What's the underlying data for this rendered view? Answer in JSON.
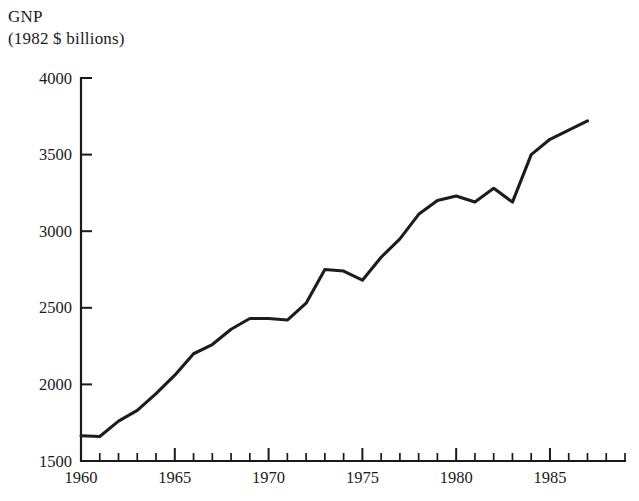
{
  "chart_data": {
    "type": "line",
    "title": "GNP",
    "subtitle": "(1982 $ billions)",
    "xlabel": "",
    "ylabel": "GNP (1982 $ billions)",
    "grid": false,
    "legend": "none",
    "xlim": [
      1960,
      1989
    ],
    "ylim": [
      1500,
      4000
    ],
    "y_ticks": [
      1500,
      2000,
      2500,
      3000,
      3500,
      4000
    ],
    "y_tick_labels": [
      "1500",
      "2000",
      "2500",
      "3000",
      "3500",
      "4000"
    ],
    "x_ticks_major": [
      1960,
      1965,
      1970,
      1975,
      1980,
      1985
    ],
    "x_tick_labels": [
      "1960",
      "1965",
      "1970",
      "1975",
      "1980",
      "1985"
    ],
    "x_ticks_minor": [
      1961,
      1962,
      1963,
      1964,
      1966,
      1967,
      1968,
      1969,
      1971,
      1972,
      1973,
      1974,
      1976,
      1977,
      1978,
      1979,
      1981,
      1982,
      1983,
      1984,
      1986,
      1987,
      1988,
      1989
    ],
    "x": [
      1960,
      1961,
      1962,
      1963,
      1964,
      1965,
      1966,
      1967,
      1968,
      1969,
      1970,
      1971,
      1972,
      1973,
      1974,
      1975,
      1976,
      1977,
      1978,
      1979,
      1980,
      1981,
      1982,
      1983,
      1984,
      1985,
      1986,
      1987
    ],
    "values": [
      1665,
      1660,
      1760,
      1830,
      1940,
      2060,
      2200,
      2260,
      2360,
      2430,
      2430,
      2420,
      2530,
      2750,
      2740,
      2680,
      2830,
      2950,
      3110,
      3200,
      3230,
      3190,
      3280,
      3190,
      3500,
      3600,
      3660,
      3720
    ],
    "series": [
      {
        "name": "GNP",
        "color": "#1c1c1c",
        "values": [
          1665,
          1660,
          1760,
          1830,
          1940,
          2060,
          2200,
          2260,
          2360,
          2430,
          2430,
          2420,
          2530,
          2750,
          2740,
          2680,
          2830,
          2950,
          3110,
          3200,
          3230,
          3190,
          3280,
          3190,
          3500,
          3600,
          3660,
          3720
        ]
      }
    ],
    "annotations": []
  },
  "axes": {
    "y_ticks": [
      {
        "label": "4000",
        "value": 4000
      },
      {
        "label": "3500",
        "value": 3500
      },
      {
        "label": "3000",
        "value": 3000
      },
      {
        "label": "2500",
        "value": 2500
      },
      {
        "label": "2000",
        "value": 2000
      },
      {
        "label": "1500",
        "value": 1500
      }
    ],
    "x_ticks": [
      {
        "label": "1960",
        "value": 1960
      },
      {
        "label": "1965",
        "value": 1965
      },
      {
        "label": "1970",
        "value": 1970
      },
      {
        "label": "1975",
        "value": 1975
      },
      {
        "label": "1980",
        "value": 1980
      },
      {
        "label": "1985",
        "value": 1985
      }
    ]
  },
  "colors": {
    "line": "#1c1c1c",
    "axis": "#1a1a1a",
    "background": "#ffffff",
    "text": "#1a1a1a"
  }
}
